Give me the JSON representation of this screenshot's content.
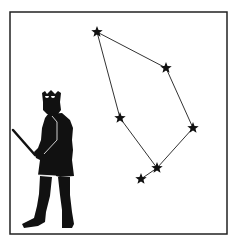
{
  "illustration": {
    "subject": "constellation with king figure",
    "background_color": "#ffffff",
    "ink_color": "#111111",
    "frame": {
      "x": 10,
      "y": 12,
      "width": 217,
      "height": 222
    },
    "stars": [
      {
        "id": "s1",
        "x": 97,
        "y": 32
      },
      {
        "id": "s2",
        "x": 166,
        "y": 68
      },
      {
        "id": "s3",
        "x": 120,
        "y": 118
      },
      {
        "id": "s4",
        "x": 193,
        "y": 128
      },
      {
        "id": "s5",
        "x": 157,
        "y": 168
      },
      {
        "id": "s6",
        "x": 141,
        "y": 179
      }
    ],
    "lines": [
      [
        "s1",
        "s2"
      ],
      [
        "s2",
        "s4"
      ],
      [
        "s4",
        "s5"
      ],
      [
        "s5",
        "s3"
      ],
      [
        "s3",
        "s1"
      ],
      [
        "s5",
        "s6"
      ]
    ],
    "figure": "king silhouette with crown holding sword"
  }
}
